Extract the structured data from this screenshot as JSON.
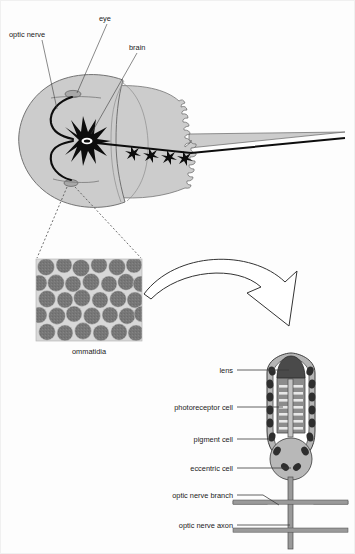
{
  "figure": {
    "background_color": "#fdfdfd"
  },
  "crab_diagram": {
    "name": "horseshoe-crab-anatomy",
    "body_fill": "#cccccc",
    "outline_color": "#555555",
    "nerve_color": "#000000",
    "labels": [
      {
        "id": "optic-nerve",
        "text": "optic nerve",
        "x": 40,
        "y": 33
      },
      {
        "id": "eye",
        "text": "eye",
        "x": 110,
        "y": 17
      },
      {
        "id": "brain",
        "text": "brain",
        "x": 142,
        "y": 47
      }
    ],
    "ganglia_count": 4
  },
  "ommatidia_panel": {
    "name": "ommatidia-micrograph",
    "caption": "ommatidia",
    "facet_color": "#777777",
    "gap_color": "#d8d8d8",
    "x": 35,
    "y": 258,
    "width": 106,
    "height": 82
  },
  "arrow": {
    "name": "magnification-arrow",
    "stroke": "#333333"
  },
  "ommatidium_diagram": {
    "name": "ommatidium-cross-section",
    "lens_color": "#4a4a4a",
    "photoreceptor_color": "#8c8c8c",
    "rhabdom_color": "#e8e8e8",
    "pigment_granule_color": "#2e2e2e",
    "sheath_color": "#b5b5b5",
    "eccentric_color": "#b8b8b8",
    "axon_color": "#9a9a9a",
    "rhabdom_rows": 7,
    "labels": [
      {
        "id": "lens",
        "text": "lens",
        "x": 232,
        "y": 371,
        "leader_x2": 268
      },
      {
        "id": "photoreceptor-cell",
        "text": "photoreceptor cell",
        "x": 232,
        "y": 409,
        "leader_x2": 262
      },
      {
        "id": "pigment-cell",
        "text": "pigment cell",
        "x": 232,
        "y": 441,
        "leader_x2": 258
      },
      {
        "id": "eccentric-cell",
        "text": "eccentric cell",
        "x": 232,
        "y": 470,
        "leader_x2": 278
      },
      {
        "id": "optic-nerve-branch",
        "text": "optic nerve branch",
        "x": 232,
        "y": 497,
        "leader_x2": 270
      },
      {
        "id": "optic-nerve-axon",
        "text": "optic nerve axon",
        "x": 232,
        "y": 527,
        "leader_x2": 282
      }
    ]
  }
}
